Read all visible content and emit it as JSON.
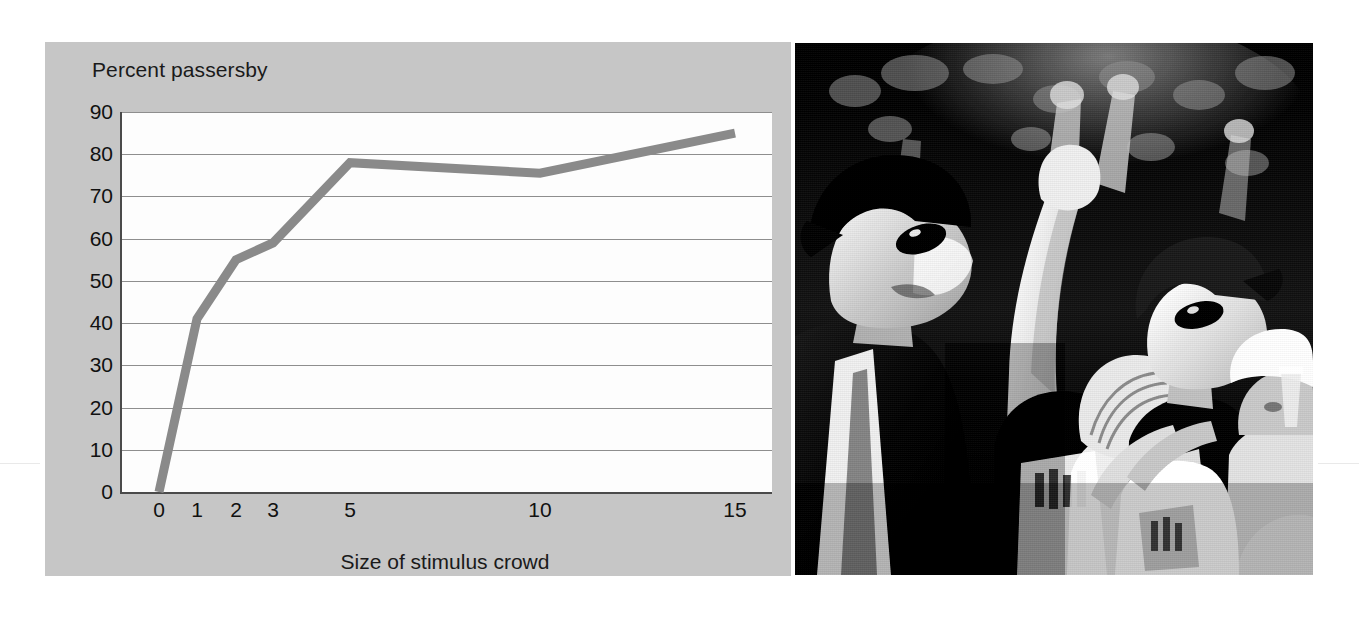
{
  "figure": {
    "background_color": "#ffffff",
    "panel_color": "#c6c6c6",
    "plot_background_color": "#fdfdfd",
    "axis_color": "#4a4a4a",
    "gridline_color": "#8e8e8e",
    "series_color": "#8a8a8a",
    "text_color": "#111111"
  },
  "chart_data": {
    "type": "line",
    "title": "Percent passersby",
    "subtitle": "",
    "xlabel": "Size of stimulus crowd",
    "ylabel": "Percent passersby",
    "x": [
      0,
      1,
      2,
      3,
      5,
      10,
      15
    ],
    "values": [
      0,
      41,
      55,
      59,
      78,
      75.5,
      85
    ],
    "series": [
      {
        "name": "Percent passersby",
        "values": [
          0,
          41,
          55,
          59,
          78,
          75.5,
          85
        ]
      }
    ],
    "x_tick_labels": [
      "0",
      "1",
      "2",
      "3",
      "5",
      "10",
      "15"
    ],
    "x_tick_positions_px": [
      37,
      75,
      114,
      151,
      228,
      418,
      613
    ],
    "y_tick_labels": [
      "0",
      "10",
      "20",
      "30",
      "40",
      "50",
      "60",
      "70",
      "80",
      "90"
    ],
    "y_ticks": [
      0,
      10,
      20,
      30,
      40,
      50,
      60,
      70,
      80,
      90
    ],
    "ylim": [
      0,
      90
    ],
    "xlim_px": [
      0,
      650
    ],
    "grid": "horizontal",
    "legend": "none",
    "x_axis_scale": "ordinal-irregular",
    "annotations": []
  },
  "photo": {
    "name": "crowd-looking-up-photo",
    "alt_description": "Black and white photograph of a crowd of people outdoors, many wearing caps and sunglasses, gazing and pointing upward at the sky",
    "color_mode": "black-and-white"
  }
}
